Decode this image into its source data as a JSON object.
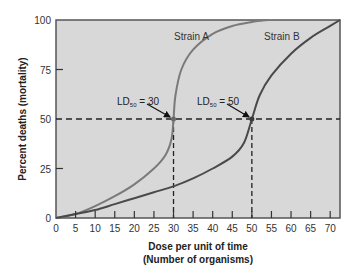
{
  "chart_data": {
    "type": "line",
    "title": "",
    "xlabel": "Dose per unit of time",
    "xlabel_line2": "(Number of organisms)",
    "ylabel": "Percent deaths (mortality)",
    "xlim": [
      0,
      72.5
    ],
    "ylim": [
      0,
      100
    ],
    "x_ticks": [
      0,
      5,
      10,
      15,
      20,
      25,
      30,
      35,
      40,
      45,
      50,
      55,
      60,
      65,
      70
    ],
    "y_ticks": [
      0,
      25,
      50,
      75,
      100
    ],
    "grid": false,
    "legend": "inline labels",
    "series": [
      {
        "name": "Strain A",
        "color": "#7a7a7a",
        "x": [
          0,
          5,
          10,
          15,
          20,
          25,
          28,
          29.5,
          30,
          30.5,
          32,
          35,
          40,
          45,
          50,
          54
        ],
        "y": [
          0,
          2,
          6,
          11,
          17,
          25,
          32,
          40,
          50,
          62,
          75,
          85,
          93,
          97,
          99,
          100
        ]
      },
      {
        "name": "Strain B",
        "color": "#4a4a4a",
        "x": [
          0,
          5,
          10,
          15,
          20,
          25,
          30,
          35,
          40,
          45,
          48,
          50,
          52,
          55,
          60,
          65,
          70,
          72.5
        ],
        "y": [
          0,
          2,
          4,
          7,
          10,
          13,
          16,
          20,
          25,
          31,
          38,
          50,
          62,
          72,
          83,
          91,
          97,
          100
        ]
      }
    ],
    "annotations": [
      {
        "text_main": "LD",
        "text_sub": "50",
        "text_rest": " = 30",
        "x": 30,
        "y": 50
      },
      {
        "text_main": "LD",
        "text_sub": "50",
        "text_rest": " = 50",
        "x": 50,
        "y": 50
      }
    ],
    "reference_lines": {
      "horizontal_y": 50,
      "vertical_x": [
        30,
        50
      ],
      "style": "dashed"
    }
  },
  "labels": {
    "strain_a": "Strain A",
    "strain_b": "Strain B",
    "ld_a_main": "LD",
    "ld_a_sub": "50",
    "ld_a_rest": " = 30",
    "ld_b_main": "LD",
    "ld_b_sub": "50",
    "ld_b_rest": " = 50",
    "ylabel": "Percent deaths (mortality)",
    "xlabel1": "Dose per unit of time",
    "xlabel2": "(Number of organisms)"
  }
}
